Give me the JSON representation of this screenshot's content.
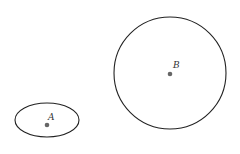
{
  "diagram": {
    "shapes": [
      {
        "type": "ellipse",
        "label": "A",
        "cx": 47,
        "cy": 120,
        "rx": 32,
        "ry": 17
      },
      {
        "type": "circle",
        "label": "B",
        "cx": 170,
        "cy": 73,
        "r": 56
      }
    ],
    "points": [
      {
        "label": "A",
        "x": 47,
        "y": 125
      },
      {
        "label": "B",
        "x": 170,
        "y": 74
      }
    ],
    "colors": {
      "stroke": "#222222",
      "point": "#666666"
    }
  }
}
